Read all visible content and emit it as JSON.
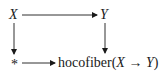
{
  "diagram": {
    "type": "commutative-square",
    "nodes": {
      "top_left": "X",
      "top_right": "Y",
      "bottom_left": "*",
      "bottom_right": {
        "prefix": "hocofiber(",
        "source": "X",
        "arrow": "→",
        "target": "Y",
        "suffix": ")"
      }
    },
    "arrows": [
      {
        "from": "X",
        "to": "Y",
        "direction": "right"
      },
      {
        "from": "X",
        "to": "*",
        "direction": "down"
      },
      {
        "from": "Y",
        "to": "hocofiber(X → Y)",
        "direction": "down"
      },
      {
        "from": "*",
        "to": "hocofiber(X → Y)",
        "direction": "right"
      }
    ],
    "colors": {
      "ink": "#1a1a1a",
      "background": "#ffffff"
    }
  }
}
